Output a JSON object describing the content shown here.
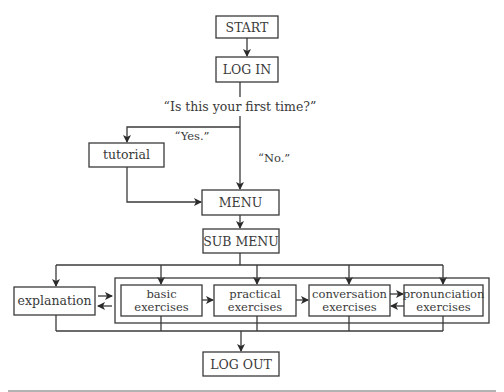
{
  "diagram": {
    "type": "flowchart",
    "nodes": {
      "start": "START",
      "login": "LOG IN",
      "tutorial": "tutorial",
      "menu": "MENU",
      "submenu": "SUB MENU",
      "explanation": "explanation",
      "basic": {
        "line1": "basic",
        "line2": "exercises"
      },
      "practical": {
        "line1": "practical",
        "line2": "exercises"
      },
      "conversation": {
        "line1": "conversation",
        "line2": "exercises"
      },
      "pronunciation": {
        "line1": "pronunciation",
        "line2": "exercises"
      },
      "logout": "LOG OUT"
    },
    "labels": {
      "question": "“Is this your first time?”",
      "yes": "“Yes.”",
      "no": "“No.”"
    },
    "edges": [
      {
        "from": "START",
        "to": "LOG IN"
      },
      {
        "from": "LOG IN",
        "to": "tutorial",
        "label": "Yes."
      },
      {
        "from": "LOG IN",
        "to": "MENU",
        "label": "No."
      },
      {
        "from": "tutorial",
        "to": "MENU"
      },
      {
        "from": "MENU",
        "to": "SUB MENU"
      },
      {
        "from": "SUB MENU",
        "to": "explanation"
      },
      {
        "from": "SUB MENU",
        "to": "basic exercises"
      },
      {
        "from": "SUB MENU",
        "to": "practical exercises"
      },
      {
        "from": "SUB MENU",
        "to": "conversation exercises"
      },
      {
        "from": "SUB MENU",
        "to": "pronunciation exercises"
      },
      {
        "from": "explanation",
        "to": "exercises group",
        "bidirectional": true
      },
      {
        "from": "basic exercises",
        "to": "practical exercises"
      },
      {
        "from": "practical exercises",
        "to": "conversation exercises"
      },
      {
        "from": "conversation exercises",
        "to": "pronunciation exercises",
        "bidirectional": true
      },
      {
        "from": "all modules",
        "to": "LOG OUT"
      }
    ]
  }
}
